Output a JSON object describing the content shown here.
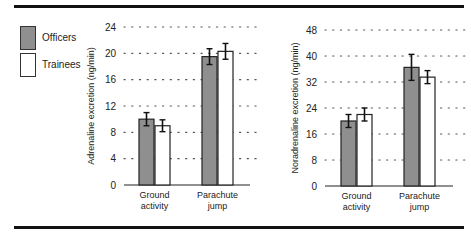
{
  "legend": {
    "items": [
      {
        "label": "Officers",
        "color": "#8f8f8f"
      },
      {
        "label": "Trainees",
        "color": "#ffffff"
      }
    ]
  },
  "chart_data": [
    {
      "type": "bar",
      "title": "",
      "xlabel": "",
      "ylabel": "Adrenaline excretion (ng/min)",
      "categories": [
        "Ground activity",
        "Parachute jump"
      ],
      "series": [
        {
          "name": "Officers",
          "values": [
            10,
            19.5
          ],
          "errors": [
            1,
            1.2
          ]
        },
        {
          "name": "Trainees",
          "values": [
            9,
            20.3
          ],
          "errors": [
            0.9,
            1.2
          ]
        }
      ],
      "yticks": [
        0,
        4,
        8,
        12,
        16,
        20,
        24
      ],
      "ylim": [
        0,
        24
      ],
      "grid": "dotted horizontal",
      "legend_position": "left"
    },
    {
      "type": "bar",
      "title": "",
      "xlabel": "",
      "ylabel": "Noradrenaline excretion (ng/min)",
      "categories": [
        "Ground activity",
        "Parachute jump"
      ],
      "series": [
        {
          "name": "Officers",
          "values": [
            20,
            36.5
          ],
          "errors": [
            2,
            4
          ]
        },
        {
          "name": "Trainees",
          "values": [
            22,
            33.5
          ],
          "errors": [
            2,
            2
          ]
        }
      ],
      "yticks": [
        0,
        8,
        16,
        24,
        32,
        40,
        48
      ],
      "ylim": [
        0,
        48
      ],
      "grid": "dotted horizontal",
      "legend_position": "left"
    }
  ],
  "category_labels": [
    [
      "Ground",
      "activity"
    ],
    [
      "Parachute",
      "jump"
    ]
  ]
}
